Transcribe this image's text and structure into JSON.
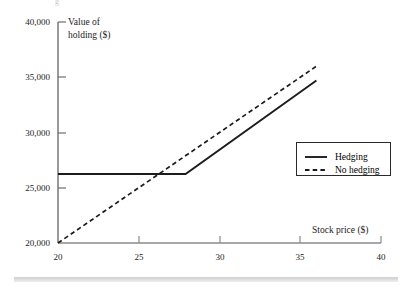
{
  "figure": {
    "background_color": "#ffffff",
    "ink_color": "#1c1c1c",
    "top_partial_glyph": "g"
  },
  "axes": {
    "y_axis_title_line1": "Value of",
    "y_axis_title_line2": "holding ($)",
    "x_axis_title": "Stock price ($)",
    "y_ticks": [
      "40,000",
      "35,000",
      "30,000",
      "25,000",
      "20,000"
    ],
    "x_ticks": [
      "20",
      "25",
      "30",
      "35",
      "40"
    ]
  },
  "legend": {
    "position": "right-middle",
    "entries": [
      {
        "label": "Hedging",
        "style": "solid",
        "color": "#1c1c1c"
      },
      {
        "label": "No hedging",
        "style": "dashed",
        "color": "#1c1c1c"
      }
    ]
  },
  "chart_data": {
    "type": "line",
    "title": "",
    "xlabel": "Stock price ($)",
    "ylabel": "Value of holding ($)",
    "xlim": [
      20,
      40
    ],
    "ylim": [
      20000,
      40000
    ],
    "xticks": [
      20,
      25,
      30,
      35,
      40
    ],
    "yticks": [
      20000,
      25000,
      30000,
      35000,
      40000
    ],
    "grid": false,
    "legend_position": "right",
    "series": [
      {
        "name": "Hedging",
        "style": "solid",
        "color": "#1c1c1c",
        "x": [
          20,
          27.9,
          36
        ],
        "y": [
          26250,
          26250,
          34700
        ]
      },
      {
        "name": "No hedging",
        "style": "dashed",
        "color": "#1c1c1c",
        "x": [
          20,
          36
        ],
        "y": [
          20000,
          36000
        ]
      }
    ]
  }
}
